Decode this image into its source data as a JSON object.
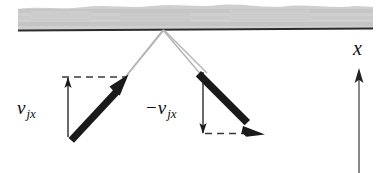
{
  "figure": {
    "background_color": "#ffffff"
  },
  "surface": {
    "name": "wall-surface",
    "band_color": "#c8c8c8",
    "band_color_light": "#d8d8d8",
    "line_color": "#2b2b2b",
    "line_y_left": 30,
    "line_y_right": 28,
    "x_start": 18,
    "x_end": 373
  },
  "vectors": [
    {
      "id": "incoming-velocity-vector",
      "label": "incoming velocity",
      "color": "#1a1a1a",
      "tail": {
        "x": 70,
        "y": 137
      },
      "tip": {
        "x": 127,
        "y": 76
      },
      "direction": "up-right"
    },
    {
      "id": "outgoing-velocity-vector",
      "label": "outgoing velocity",
      "color": "#1a1a1a",
      "tail": {
        "x": 202,
        "y": 72
      },
      "tip": {
        "x": 264,
        "y": 134
      },
      "direction": "down-right"
    }
  ],
  "trajectory": {
    "name": "incident-reflected-path",
    "color": "#b3b3b3",
    "vertex": {
      "x": 163,
      "y": 30
    },
    "incoming_from": {
      "x": 127,
      "y": 76
    },
    "outgoing_to": {
      "x": 202,
      "y": 72
    }
  },
  "components": {
    "left": {
      "name": "normal-component-up",
      "label_sign": "",
      "label_base": "v",
      "label_sub": "jx",
      "arrow_direction": "up",
      "measure_x": 68,
      "measure_top": 77,
      "measure_bottom": 137,
      "dashed_y": 77,
      "dashed_x_start": 62,
      "dashed_x_end": 127
    },
    "right": {
      "name": "normal-component-down",
      "label_sign": "−",
      "label_base": "v",
      "label_sub": "jx",
      "arrow_direction": "down",
      "measure_x": 203,
      "measure_top": 73,
      "measure_bottom": 133,
      "dashed_y": 133,
      "dashed_x_start": 205,
      "dashed_x_end": 264
    },
    "dash_color": "#3a3a3a",
    "tick_color": "#1a1a1a"
  },
  "axis": {
    "name": "x-axis",
    "label": "x",
    "color": "#333333",
    "shaft_x": 359,
    "shaft_top": 70,
    "shaft_bottom": 173,
    "label_x": 353,
    "label_y": 38
  }
}
